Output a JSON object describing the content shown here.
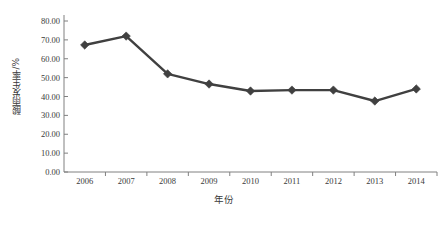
{
  "chart_data": {
    "type": "line",
    "title": "",
    "xlabel": "年份",
    "ylabel": "酸雨发生率/%",
    "categories": [
      "2006",
      "2007",
      "2008",
      "2009",
      "2010",
      "2011",
      "2012",
      "2013",
      "2014"
    ],
    "values": [
      67.3,
      72.0,
      52.0,
      46.6,
      42.9,
      43.4,
      43.4,
      37.6,
      44.0
    ],
    "series": [
      {
        "name": "酸雨发生率/%",
        "values": [
          67.3,
          72.0,
          52.0,
          46.6,
          42.9,
          43.4,
          43.4,
          37.6,
          44.0
        ]
      }
    ],
    "ylim": [
      0,
      80
    ],
    "ytick_values": [
      0,
      10,
      20,
      30,
      40,
      50,
      60,
      70,
      80
    ],
    "ytick_labels": [
      "0.00",
      "10.00",
      "20.00",
      "30.00",
      "40.00",
      "50.00",
      "60.00",
      "70.00",
      "80.00"
    ],
    "grid": false,
    "legend": "none",
    "marker": "diamond",
    "line_color": "#404040",
    "marker_color": "#404040",
    "axis_color": "#808080",
    "background_color": "#ffffff"
  },
  "axis": {
    "y_title": "酸雨发生率/%",
    "x_title": "年份"
  }
}
